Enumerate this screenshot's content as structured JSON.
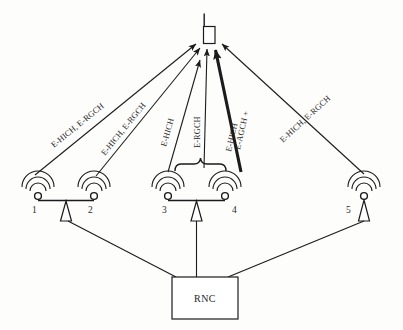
{
  "diagram": {
    "background_color": "#fdfdfc",
    "line_color": "#1b1b1b"
  },
  "ue": {
    "icon": "mobile-handset-icon",
    "label": ""
  },
  "controller": {
    "label": "RNC"
  },
  "base_stations": [
    {
      "id": "1",
      "label": "1",
      "icon": "antenna-icon"
    },
    {
      "id": "2",
      "label": "2",
      "icon": "antenna-icon"
    },
    {
      "id": "3",
      "label": "3",
      "icon": "antenna-icon"
    },
    {
      "id": "4",
      "label": "4",
      "icon": "antenna-icon"
    },
    {
      "id": "5",
      "label": "5",
      "icon": "antenna-icon"
    }
  ],
  "channel_labels": [
    {
      "id": "link-1",
      "text": "E-HICH, E-RGCH",
      "from": "1",
      "to": "ue",
      "emphasis": "normal"
    },
    {
      "id": "link-2",
      "text": "E-HICH, E-RGCH",
      "from": "2",
      "to": "ue",
      "emphasis": "normal"
    },
    {
      "id": "link-3",
      "text": "E-HICH",
      "from": "3",
      "to": "ue",
      "emphasis": "normal"
    },
    {
      "id": "link-4",
      "text": "E-RGCH",
      "from": "3",
      "to": "ue",
      "emphasis": "normal"
    },
    {
      "id": "link-5-line1",
      "text": "E-AGCH +",
      "from": "4",
      "to": "ue",
      "emphasis": "bold"
    },
    {
      "id": "link-5-line2",
      "text": "E-HICH",
      "from": "4",
      "to": "ue",
      "emphasis": "bold"
    },
    {
      "id": "link-6",
      "text": "E-HICH, E-RGCH",
      "from": "5",
      "to": "ue",
      "emphasis": "normal"
    }
  ],
  "brace": {
    "name": "serving-cell-brace",
    "spans": [
      "3",
      "4"
    ]
  }
}
